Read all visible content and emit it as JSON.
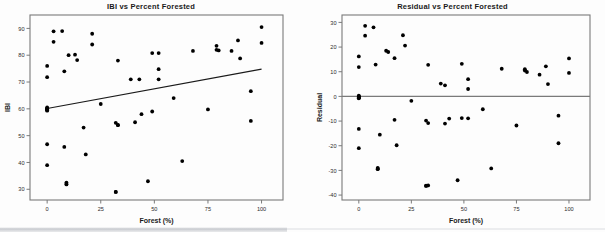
{
  "figure": {
    "background_color": "#fdfdfd",
    "point_color": "#000000",
    "axis_color": "#7a7a7a",
    "line_color": "#1a1a1a"
  },
  "charts": [
    {
      "id": "ibi-vs-percent-forested",
      "title": "IBI vs Percent Forested",
      "xlabel": "Forest (%)",
      "ylabel": "IBI"
    },
    {
      "id": "residual-vs-percent-forested",
      "title": "Residual vs Percent Forested",
      "xlabel": "Forest (%)",
      "ylabel": "Residual"
    }
  ],
  "chart_data": [
    {
      "type": "scatter",
      "title": "IBI vs Percent Forested",
      "xlabel": "Forest (%)",
      "ylabel": "IBI",
      "xlim": [
        -8,
        110
      ],
      "ylim": [
        26,
        95
      ],
      "xticks": [
        0,
        25,
        50,
        75,
        100
      ],
      "yticks": [
        30,
        40,
        50,
        60,
        70,
        80,
        90
      ],
      "grid": false,
      "legend": null,
      "trendline": {
        "type": "linear-fit",
        "x": [
          0,
          100
        ],
        "y": [
          60.1,
          74.8
        ]
      },
      "x": [
        0,
        0,
        0,
        0,
        0,
        0,
        0,
        0,
        0,
        0,
        3,
        3,
        7,
        8,
        8,
        9,
        9,
        9,
        10,
        13,
        14,
        17,
        18,
        21,
        21,
        25,
        32,
        32,
        32,
        33,
        33,
        33,
        39,
        41,
        43,
        44,
        47,
        49,
        49,
        52,
        52,
        52,
        59,
        63,
        68,
        75,
        79,
        79,
        80,
        86,
        89,
        90,
        95,
        95,
        100,
        100
      ],
      "y": [
        60.5,
        60.2,
        59.8,
        59.5,
        71.8,
        76.0,
        46.8,
        39.0,
        60.0,
        59.3,
        88.9,
        85.0,
        89.0,
        74.0,
        45.8,
        32.5,
        32.0,
        31.8,
        80.0,
        80.2,
        78.2,
        53.0,
        43.0,
        88.0,
        84.0,
        61.8,
        29.0,
        29.0,
        54.8,
        53.9,
        54.0,
        78.0,
        71.0,
        55.0,
        71.0,
        58.0,
        33.0,
        59.0,
        80.8,
        74.8,
        71.0,
        80.8,
        64.0,
        40.5,
        81.6,
        59.8,
        83.5,
        82.0,
        81.8,
        81.6,
        85.5,
        78.8,
        66.6,
        55.5,
        90.5,
        84.6
      ]
    },
    {
      "type": "scatter",
      "title": "Residual vs Percent Forested",
      "xlabel": "Forest (%)",
      "ylabel": "Residual",
      "xlim": [
        -8,
        110
      ],
      "ylim": [
        -42,
        33
      ],
      "xticks": [
        0,
        25,
        50,
        75,
        100
      ],
      "yticks": [
        -40,
        -30,
        -20,
        -10,
        0,
        10,
        20,
        30
      ],
      "grid": false,
      "legend": null,
      "reference_line": {
        "type": "horizontal",
        "y": 0
      },
      "x": [
        0,
        0,
        0,
        0,
        0,
        0,
        0,
        0,
        0,
        0,
        3,
        3,
        7,
        8,
        9,
        9,
        9,
        10,
        13,
        14,
        17,
        17,
        18,
        21,
        22,
        25,
        32,
        32,
        32,
        33,
        33,
        33,
        39,
        41,
        41,
        43,
        47,
        49,
        49,
        52,
        52,
        52,
        59,
        63,
        68,
        75,
        79,
        79,
        80,
        86,
        89,
        90,
        95,
        95,
        100,
        100
      ],
      "y": [
        0.3,
        0.0,
        -0.4,
        -0.8,
        11.9,
        16.2,
        -13.2,
        -21.0,
        -0.2,
        -0.6,
        28.6,
        24.6,
        28.0,
        12.9,
        -29.0,
        -29.5,
        -29.3,
        -15.5,
        18.5,
        18.0,
        15.5,
        -9.5,
        -19.8,
        24.8,
        20.6,
        -1.8,
        -36.2,
        -36.3,
        -9.8,
        -10.8,
        12.8,
        -36.1,
        5.2,
        4.5,
        -11.0,
        -9.0,
        -34.0,
        -8.8,
        13.2,
        7.0,
        3.0,
        -8.9,
        -5.2,
        -29.2,
        11.2,
        -11.8,
        11.0,
        10.5,
        9.9,
        8.8,
        12.2,
        5.0,
        -7.8,
        -19.0,
        15.4,
        9.5
      ]
    }
  ]
}
